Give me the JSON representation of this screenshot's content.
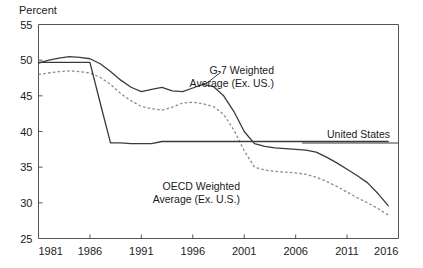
{
  "chart_data": {
    "type": "line",
    "title": "",
    "subtitle": "",
    "ylabel": "Percent",
    "xlabel": "",
    "ylim": [
      25,
      55
    ],
    "xlim": [
      1981,
      2016
    ],
    "yticks": [
      25,
      30,
      35,
      40,
      45,
      50,
      55
    ],
    "ytick_labels": [
      "25",
      "30",
      "35",
      "40",
      "45",
      "50",
      "55"
    ],
    "xticks": [
      1981,
      1986,
      1991,
      1996,
      2001,
      2006,
      2011,
      2016
    ],
    "xtick_labels": [
      "1981",
      "1986",
      "1991",
      "1996",
      "2001",
      "2006",
      "2011",
      "2016"
    ],
    "grid": false,
    "legend_position": "inline-annotations",
    "series": [
      {
        "name": "G-7 Weighted Average (Ex. US.)",
        "style": "solid",
        "color": "#3a3a3a",
        "x": [
          1981,
          1982,
          1983,
          1984,
          1985,
          1986,
          1987,
          1988,
          1989,
          1990,
          1991,
          1992,
          1993,
          1994,
          1995,
          1996,
          1997,
          1998,
          1999,
          2000,
          2001,
          2002,
          2003,
          2004,
          2005,
          2006,
          2007,
          2008,
          2009,
          2010,
          2011,
          2012,
          2013,
          2014,
          2015
        ],
        "values": [
          49.6,
          50.0,
          50.3,
          50.5,
          50.4,
          50.2,
          49.5,
          48.4,
          47.2,
          46.2,
          45.6,
          45.9,
          46.2,
          45.7,
          45.6,
          46.1,
          46.6,
          46.3,
          45.0,
          42.8,
          40.0,
          38.3,
          37.9,
          37.7,
          37.6,
          37.5,
          37.4,
          37.1,
          36.4,
          35.6,
          34.7,
          33.8,
          32.8,
          31.3,
          29.6
        ]
      },
      {
        "name": "OECD Weighted Average (Ex. U.S.)",
        "style": "dashed",
        "color": "#8a8a8a",
        "x": [
          1981,
          1982,
          1983,
          1984,
          1985,
          1986,
          1987,
          1988,
          1989,
          1990,
          1991,
          1992,
          1993,
          1994,
          1995,
          1996,
          1997,
          1998,
          1999,
          2000,
          2001,
          2002,
          2003,
          2004,
          2005,
          2006,
          2007,
          2008,
          2009,
          2010,
          2011,
          2012,
          2013,
          2014,
          2015
        ],
        "values": [
          48.0,
          48.2,
          48.4,
          48.5,
          48.4,
          48.2,
          47.6,
          46.6,
          45.3,
          44.3,
          43.5,
          43.2,
          43.0,
          43.4,
          44.0,
          44.1,
          43.9,
          43.5,
          42.4,
          40.2,
          37.3,
          35.0,
          34.6,
          34.4,
          34.3,
          34.2,
          34.0,
          33.6,
          33.0,
          32.3,
          31.5,
          30.7,
          30.0,
          29.2,
          28.3
        ]
      },
      {
        "name": "United States",
        "style": "solid",
        "color": "#3a3a3a",
        "x": [
          1981,
          1982,
          1983,
          1984,
          1985,
          1986,
          1987,
          1988,
          1989,
          1990,
          1991,
          1992,
          1993,
          1994,
          1995,
          1996,
          1997,
          1998,
          1999,
          2000,
          2001,
          2002,
          2003,
          2004,
          2005,
          2006,
          2007,
          2008,
          2009,
          2010,
          2011,
          2012,
          2013,
          2014,
          2015
        ],
        "values": [
          49.7,
          49.7,
          49.7,
          49.7,
          49.7,
          49.7,
          44.0,
          38.4,
          38.4,
          38.3,
          38.3,
          38.3,
          38.6,
          38.6,
          38.6,
          38.6,
          38.6,
          38.6,
          38.6,
          38.6,
          38.6,
          38.6,
          38.6,
          38.6,
          38.6,
          38.6,
          38.6,
          38.6,
          38.6,
          38.6,
          38.6,
          38.6,
          38.6,
          38.6,
          38.6
        ]
      }
    ],
    "annotations": [
      {
        "id": "g7-label",
        "lines": [
          "G-7 Weighted",
          "Average (Ex. US.)"
        ],
        "x_px": 274,
        "y_px": 74
      },
      {
        "id": "oecd-label",
        "lines": [
          "OECD Weighted",
          "Average (Ex. U.S.)"
        ],
        "x_px": 240,
        "y_px": 190
      },
      {
        "id": "us-label",
        "lines": [
          "United States"
        ],
        "x_px": 390,
        "y_px": 138
      }
    ]
  }
}
